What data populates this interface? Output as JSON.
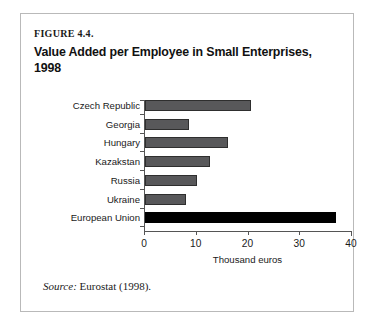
{
  "figure": {
    "label": "FIGURE 4.4.",
    "title": "Value Added per Employee in Small Enterprises, 1998",
    "source_word": "Source:",
    "source_text": " Eurostat (1998)."
  },
  "colors": {
    "bar_gray": "#58585a",
    "bar_gray_border": "#2e2e2e",
    "bar_highlight": "#000000",
    "axis": "#555555",
    "frame_border": "#b9b9b9",
    "text": "#1a1a1a",
    "background": "#ffffff"
  },
  "chart_data": {
    "type": "bar",
    "orientation": "horizontal",
    "title": "Value Added per Employee in Small Enterprises, 1998",
    "xlabel": "Thousand euros",
    "ylabel": "",
    "categories": [
      "Czech Republic",
      "Georgia",
      "Hungary",
      "Kazakstan",
      "Russia",
      "Ukraine",
      "European Union"
    ],
    "values": [
      20.5,
      8.5,
      16.0,
      12.5,
      10.0,
      8.0,
      37.0
    ],
    "highlight_category": "European Union",
    "xlim": [
      0,
      40
    ],
    "xticks": [
      0,
      10,
      20,
      30,
      40
    ],
    "xtick_labels": [
      "0",
      "10",
      "20",
      "30",
      "40"
    ],
    "grid": false,
    "legend": false
  }
}
